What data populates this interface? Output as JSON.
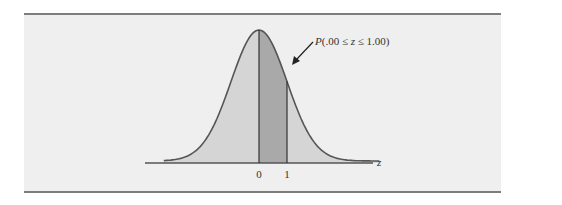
{
  "figure": {
    "annotation": "P(.00 ≤ z ≤ 1.00)",
    "annotation_parts": {
      "p": "P",
      "open": "(.00 ≤ ",
      "z": "z",
      "close": " ≤ 1.00)"
    },
    "axis_label": "z",
    "ticks": [
      "0",
      "1"
    ],
    "shaded_interval": {
      "from": 0,
      "to": 1
    },
    "distribution": "standard normal",
    "colors": {
      "panel": "#efefef",
      "curve_fill": "#d5d5d5",
      "shaded_fill": "#a9a9a9",
      "curve_stroke": "#555555",
      "rule": "#7d7d7d"
    }
  }
}
